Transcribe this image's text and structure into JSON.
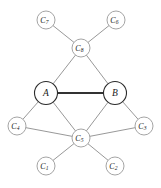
{
  "diagram": {
    "width": 161,
    "height": 188,
    "background_color": "#ffffff",
    "edge_color": "#8c8c8c",
    "emphasis_edge_color": "#333333",
    "node_fill": "#ffffff",
    "minor_node_stroke": "#9a9a9a",
    "major_node_stroke": "#2b2b2b",
    "label_color": "#1a1a1a"
  },
  "nodes": [
    {
      "id": "A",
      "label": "A",
      "base": "A",
      "subscript": "",
      "cx": 46,
      "cy": 93,
      "r": 11.5,
      "kind": "major"
    },
    {
      "id": "B",
      "label": "B",
      "base": "B",
      "subscript": "",
      "cx": 115,
      "cy": 93,
      "r": 11.5,
      "kind": "major"
    },
    {
      "id": "C1",
      "label": "C1",
      "base": "C",
      "subscript": "1",
      "cx": 46,
      "cy": 166,
      "r": 9.0,
      "kind": "minor"
    },
    {
      "id": "C2",
      "label": "C2",
      "base": "C",
      "subscript": "2",
      "cx": 115,
      "cy": 166,
      "r": 9.0,
      "kind": "minor"
    },
    {
      "id": "C3",
      "label": "C3",
      "base": "C",
      "subscript": "3",
      "cx": 144,
      "cy": 126,
      "r": 9.0,
      "kind": "minor"
    },
    {
      "id": "C4",
      "label": "C4",
      "base": "C",
      "subscript": "4",
      "cx": 17,
      "cy": 126,
      "r": 9.0,
      "kind": "minor"
    },
    {
      "id": "C5",
      "label": "C5",
      "base": "C",
      "subscript": "5",
      "cx": 81,
      "cy": 138,
      "r": 9.0,
      "kind": "minor"
    },
    {
      "id": "C6",
      "label": "C6",
      "base": "C",
      "subscript": "6",
      "cx": 116,
      "cy": 20,
      "r": 9.0,
      "kind": "minor"
    },
    {
      "id": "C7",
      "label": "C7",
      "base": "C",
      "subscript": "7",
      "cx": 46,
      "cy": 20,
      "r": 9.0,
      "kind": "minor"
    },
    {
      "id": "C8",
      "label": "C8",
      "base": "C",
      "subscript": "8",
      "cx": 81,
      "cy": 48,
      "r": 9.0,
      "kind": "minor"
    }
  ],
  "edges": [
    {
      "from": "A",
      "to": "B",
      "emphasis": true
    },
    {
      "from": "C8",
      "to": "A",
      "emphasis": false
    },
    {
      "from": "C8",
      "to": "B",
      "emphasis": false
    },
    {
      "from": "C8",
      "to": "C7",
      "emphasis": false
    },
    {
      "from": "C8",
      "to": "C6",
      "emphasis": false
    },
    {
      "from": "A",
      "to": "C4",
      "emphasis": false
    },
    {
      "from": "A",
      "to": "C5",
      "emphasis": false
    },
    {
      "from": "B",
      "to": "C3",
      "emphasis": false
    },
    {
      "from": "B",
      "to": "C5",
      "emphasis": false
    },
    {
      "from": "C5",
      "to": "C4",
      "emphasis": false
    },
    {
      "from": "C5",
      "to": "C3",
      "emphasis": false
    },
    {
      "from": "C5",
      "to": "C1",
      "emphasis": false
    },
    {
      "from": "C5",
      "to": "C2",
      "emphasis": false
    }
  ]
}
